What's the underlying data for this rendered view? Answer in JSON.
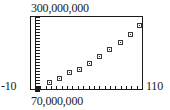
{
  "chart_data": {
    "type": "scatter",
    "title": "",
    "subtitle": "",
    "xlabel": "",
    "ylabel": "",
    "xlim": [
      -10,
      110
    ],
    "ylim": [
      70000000,
      300000000
    ],
    "x_axis_min_label": "-10",
    "x_axis_max_label": "110",
    "y_axis_min_label": "70,000,000",
    "y_axis_max_label": "300,000,000",
    "grid": false,
    "legend": null,
    "frame": "box",
    "marker_style": "open-square",
    "x": [
      0,
      10,
      20,
      30,
      40,
      50,
      60,
      70,
      80,
      90,
      100
    ],
    "y": [
      73000000,
      92000000,
      104000000,
      123000000,
      132000000,
      151000000,
      172000000,
      194000000,
      216000000,
      240000000,
      266000000
    ],
    "points": [
      {
        "x": 0,
        "y": 73000000,
        "px": 2,
        "py": 72
      },
      {
        "x": 10,
        "y": 92000000,
        "px": 14,
        "py": 65
      },
      {
        "x": 20,
        "y": 104000000,
        "px": 24,
        "py": 61
      },
      {
        "x": 30,
        "y": 123000000,
        "px": 34,
        "py": 55
      },
      {
        "x": 40,
        "y": 132000000,
        "px": 44,
        "py": 52
      },
      {
        "x": 50,
        "y": 151000000,
        "px": 54,
        "py": 46
      },
      {
        "x": 60,
        "y": 172000000,
        "px": 64,
        "py": 39
      },
      {
        "x": 70,
        "y": 194000000,
        "px": 74,
        "py": 32
      },
      {
        "x": 80,
        "y": 216000000,
        "px": 85,
        "py": 25
      },
      {
        "x": 90,
        "y": 240000000,
        "px": 95,
        "py": 17
      },
      {
        "x": 100,
        "y": 266000000,
        "px": 104,
        "py": 8
      }
    ],
    "axis_line_x_px": 4,
    "x_tick_count": 20,
    "colors": {
      "frame": "#1a1a1a",
      "marker": "#3a3a3a",
      "text": "#1a1a1a",
      "background": "#ffffff"
    }
  }
}
